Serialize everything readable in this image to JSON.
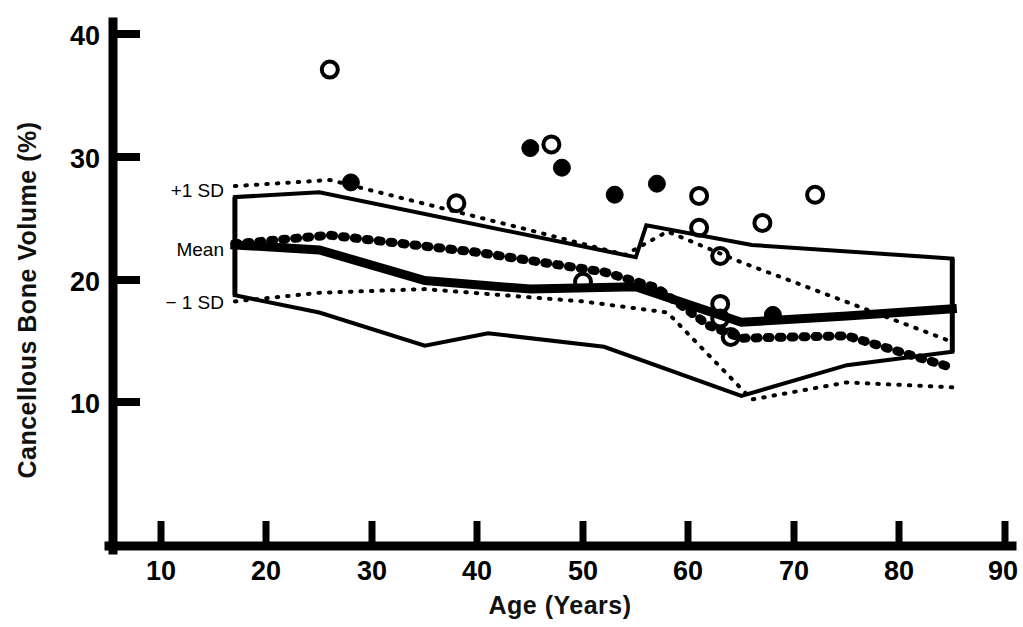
{
  "chart_data": {
    "type": "scatter",
    "title": "",
    "xlabel": "Age (Years)",
    "ylabel": "Cancellous Bone Volume (%)",
    "xlim": [
      0,
      95
    ],
    "ylim": [
      0,
      42
    ],
    "xticks": [
      10,
      20,
      30,
      40,
      50,
      60,
      70,
      80,
      90
    ],
    "yticks": [
      10,
      20,
      30,
      40
    ],
    "grid": false,
    "legend_position": "none",
    "band_labels": {
      "upper": "+1 SD",
      "mean": "Mean",
      "lower": "− 1 SD"
    },
    "series": [
      {
        "name": "Filled circles",
        "marker": "filled-circle",
        "points": [
          {
            "age": 28,
            "value": 27.9
          },
          {
            "age": 45,
            "value": 30.7
          },
          {
            "age": 48,
            "value": 29.1
          },
          {
            "age": 53,
            "value": 26.9
          },
          {
            "age": 57,
            "value": 27.8
          },
          {
            "age": 68,
            "value": 17.1
          }
        ]
      },
      {
        "name": "Open circles",
        "marker": "open-circle",
        "points": [
          {
            "age": 26,
            "value": 37.1
          },
          {
            "age": 38,
            "value": 26.2
          },
          {
            "age": 47,
            "value": 31.0
          },
          {
            "age": 50,
            "value": 19.8
          },
          {
            "age": 61,
            "value": 24.2
          },
          {
            "age": 61,
            "value": 26.8
          },
          {
            "age": 63,
            "value": 21.9
          },
          {
            "age": 63,
            "value": 18.0
          },
          {
            "age": 63,
            "value": 16.8
          },
          {
            "age": 64,
            "value": 15.3
          },
          {
            "age": 67,
            "value": 24.6
          },
          {
            "age": 72,
            "value": 26.9
          }
        ]
      },
      {
        "name": "Reference solid band - upper (+1 SD)",
        "marker": "solid-line",
        "points": [
          {
            "age": 17,
            "value": 26.7
          },
          {
            "age": 25,
            "value": 27.1
          },
          {
            "age": 55,
            "value": 21.8
          },
          {
            "age": 56,
            "value": 24.4
          },
          {
            "age": 66,
            "value": 22.8
          },
          {
            "age": 85,
            "value": 21.7
          }
        ]
      },
      {
        "name": "Reference solid band - mean",
        "marker": "solid-line-thick",
        "points": [
          {
            "age": 17,
            "value": 22.8
          },
          {
            "age": 25,
            "value": 22.4
          },
          {
            "age": 35,
            "value": 19.9
          },
          {
            "age": 45,
            "value": 19.2
          },
          {
            "age": 55,
            "value": 19.4
          },
          {
            "age": 65,
            "value": 16.5
          },
          {
            "age": 75,
            "value": 17.0
          },
          {
            "age": 85,
            "value": 17.6
          }
        ]
      },
      {
        "name": "Reference solid band - lower (-1 SD)",
        "marker": "solid-line",
        "points": [
          {
            "age": 17,
            "value": 18.7
          },
          {
            "age": 25,
            "value": 17.3
          },
          {
            "age": 35,
            "value": 14.6
          },
          {
            "age": 41,
            "value": 15.6
          },
          {
            "age": 52,
            "value": 14.5
          },
          {
            "age": 65,
            "value": 10.5
          },
          {
            "age": 75,
            "value": 13.0
          },
          {
            "age": 85,
            "value": 14.1
          }
        ]
      },
      {
        "name": "Patient dotted band - upper",
        "marker": "dotted-line",
        "points": [
          {
            "age": 17,
            "value": 27.6
          },
          {
            "age": 26,
            "value": 28.1
          },
          {
            "age": 45,
            "value": 24.0
          },
          {
            "age": 54,
            "value": 22.0
          },
          {
            "age": 58,
            "value": 23.9
          },
          {
            "age": 65,
            "value": 21.4
          },
          {
            "age": 85,
            "value": 14.9
          }
        ]
      },
      {
        "name": "Patient dotted band - mean",
        "marker": "dotted-line-thick",
        "points": [
          {
            "age": 17,
            "value": 22.9
          },
          {
            "age": 26,
            "value": 23.6
          },
          {
            "age": 40,
            "value": 22.2
          },
          {
            "age": 52,
            "value": 20.6
          },
          {
            "age": 57,
            "value": 19.3
          },
          {
            "age": 62,
            "value": 16.2
          },
          {
            "age": 65,
            "value": 15.2
          },
          {
            "age": 75,
            "value": 15.4
          },
          {
            "age": 85,
            "value": 12.8
          }
        ]
      },
      {
        "name": "Patient dotted band - lower",
        "marker": "dotted-line",
        "points": [
          {
            "age": 17,
            "value": 18.2
          },
          {
            "age": 25,
            "value": 18.9
          },
          {
            "age": 35,
            "value": 19.2
          },
          {
            "age": 50,
            "value": 18.2
          },
          {
            "age": 58,
            "value": 17.3
          },
          {
            "age": 66,
            "value": 10.2
          },
          {
            "age": 75,
            "value": 11.6
          },
          {
            "age": 85,
            "value": 11.2
          }
        ]
      }
    ]
  },
  "axes": {
    "y_title": "Cancellous Bone Volume (%)",
    "x_title": "Age (Years)",
    "y_tick_labels": [
      "40",
      "30",
      "20",
      "10"
    ],
    "x_tick_labels": [
      "10",
      "20",
      "30",
      "40",
      "50",
      "60",
      "70",
      "80",
      "90"
    ]
  },
  "annotations": {
    "plus_1_sd": "+1 SD",
    "mean": "Mean",
    "minus_1_sd": "− 1 SD"
  }
}
